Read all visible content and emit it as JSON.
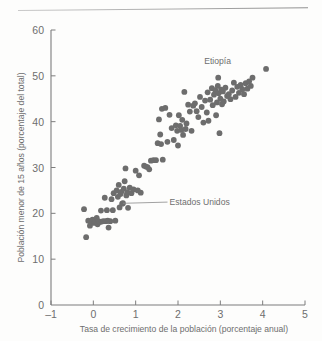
{
  "figure": {
    "kind": "scatter-plot",
    "dot_color": "#6d6d6d",
    "axis_color": "#7d7d7d",
    "text_color": "#6e6e6e"
  },
  "chart_data": {
    "type": "scatter",
    "title": "",
    "xlabel": "Tasa de crecimiento de la población (porcentaje anual)",
    "ylabel": "Población menor de 15 años (porcentaje del total)",
    "xlim": [
      -1,
      5
    ],
    "ylim": [
      0,
      60
    ],
    "xticks": [
      -1,
      0,
      1,
      2,
      3,
      4,
      5
    ],
    "xtick_labels": [
      "–1",
      "0",
      "1",
      "2",
      "3",
      "4",
      "5"
    ],
    "yticks": [
      0,
      10,
      20,
      30,
      40,
      50,
      60
    ],
    "ytick_labels": [
      "0",
      "10",
      "20",
      "30",
      "40",
      "50",
      "60"
    ],
    "grid": false,
    "legend": null,
    "annotations": [
      {
        "label": "Etiopía",
        "text_x": 2.62,
        "text_y": 52.6,
        "point_x": 2.95,
        "point_y": 49.6,
        "leader": false
      },
      {
        "label": "Estados Unidos",
        "text_x": 1.8,
        "text_y": 21.8,
        "point_x": 0.7,
        "point_y": 22.2,
        "leader": true
      }
    ],
    "points": [
      [
        -0.22,
        20.9
      ],
      [
        -0.17,
        14.8
      ],
      [
        -0.12,
        18.4
      ],
      [
        -0.08,
        17.3
      ],
      [
        -0.05,
        18.0
      ],
      [
        -0.02,
        18.6
      ],
      [
        0.02,
        17.9
      ],
      [
        0.05,
        18.2
      ],
      [
        0.08,
        19.0
      ],
      [
        0.1,
        17.6
      ],
      [
        0.12,
        18.3
      ],
      [
        0.15,
        18.1
      ],
      [
        0.18,
        20.6
      ],
      [
        0.2,
        18.2
      ],
      [
        0.24,
        18.3
      ],
      [
        0.27,
        23.4
      ],
      [
        0.3,
        18.3
      ],
      [
        0.32,
        20.7
      ],
      [
        0.34,
        18.4
      ],
      [
        0.36,
        16.9
      ],
      [
        0.4,
        18.3
      ],
      [
        0.43,
        23.1
      ],
      [
        0.46,
        20.7
      ],
      [
        0.48,
        24.4
      ],
      [
        0.52,
        18.4
      ],
      [
        0.55,
        25.0
      ],
      [
        0.58,
        23.6
      ],
      [
        0.6,
        26.2
      ],
      [
        0.62,
        21.3
      ],
      [
        0.64,
        24.2
      ],
      [
        0.66,
        24.7
      ],
      [
        0.68,
        22.1
      ],
      [
        0.7,
        22.2
      ],
      [
        0.72,
        25.4
      ],
      [
        0.74,
        27.0
      ],
      [
        0.76,
        29.8
      ],
      [
        0.78,
        23.9
      ],
      [
        0.8,
        24.6
      ],
      [
        0.82,
        21.2
      ],
      [
        0.86,
        25.6
      ],
      [
        0.9,
        24.4
      ],
      [
        0.95,
        25.2
      ],
      [
        1.0,
        29.3
      ],
      [
        1.05,
        25.0
      ],
      [
        1.08,
        28.3
      ],
      [
        1.12,
        24.5
      ],
      [
        1.2,
        30.4
      ],
      [
        1.24,
        30.2
      ],
      [
        1.28,
        30.1
      ],
      [
        1.32,
        29.6
      ],
      [
        1.36,
        31.5
      ],
      [
        1.42,
        31.6
      ],
      [
        1.48,
        31.6
      ],
      [
        1.52,
        35.3
      ],
      [
        1.55,
        40.5
      ],
      [
        1.58,
        37.2
      ],
      [
        1.6,
        35.1
      ],
      [
        1.62,
        42.8
      ],
      [
        1.64,
        31.7
      ],
      [
        1.7,
        43.0
      ],
      [
        1.75,
        35.6
      ],
      [
        1.8,
        41.5
      ],
      [
        1.85,
        38.6
      ],
      [
        1.9,
        36.0
      ],
      [
        1.95,
        39.2
      ],
      [
        1.98,
        38.0
      ],
      [
        2.0,
        34.8
      ],
      [
        2.02,
        41.4
      ],
      [
        2.05,
        39.1
      ],
      [
        2.08,
        38.2
      ],
      [
        2.1,
        40.4
      ],
      [
        2.12,
        37.1
      ],
      [
        2.15,
        46.5
      ],
      [
        2.18,
        38.4
      ],
      [
        2.2,
        39.6
      ],
      [
        2.24,
        43.7
      ],
      [
        2.28,
        42.2
      ],
      [
        2.32,
        38.0
      ],
      [
        2.36,
        43.5
      ],
      [
        2.4,
        44.0
      ],
      [
        2.44,
        42.3
      ],
      [
        2.48,
        41.0
      ],
      [
        2.52,
        45.4
      ],
      [
        2.56,
        43.2
      ],
      [
        2.6,
        39.8
      ],
      [
        2.64,
        44.6
      ],
      [
        2.68,
        42.0
      ],
      [
        2.7,
        46.4
      ],
      [
        2.72,
        40.2
      ],
      [
        2.76,
        44.8
      ],
      [
        2.8,
        47.3
      ],
      [
        2.82,
        43.6
      ],
      [
        2.85,
        45.9
      ],
      [
        2.88,
        46.9
      ],
      [
        2.9,
        41.4
      ],
      [
        2.92,
        44.2
      ],
      [
        2.94,
        47.8
      ],
      [
        2.95,
        49.6
      ],
      [
        2.96,
        46.2
      ],
      [
        2.98,
        37.5
      ],
      [
        3.0,
        45.0
      ],
      [
        3.02,
        47.0
      ],
      [
        3.04,
        43.8
      ],
      [
        3.06,
        46.6
      ],
      [
        3.08,
        44.4
      ],
      [
        3.12,
        47.4
      ],
      [
        3.16,
        45.6
      ],
      [
        3.2,
        46.0
      ],
      [
        3.24,
        44.9
      ],
      [
        3.28,
        46.8
      ],
      [
        3.32,
        48.5
      ],
      [
        3.36,
        45.4
      ],
      [
        3.4,
        47.6
      ],
      [
        3.44,
        46.3
      ],
      [
        3.48,
        48.0
      ],
      [
        3.52,
        47.1
      ],
      [
        3.56,
        46.0
      ],
      [
        3.6,
        48.4
      ],
      [
        3.64,
        47.2
      ],
      [
        3.68,
        48.8
      ],
      [
        3.72,
        47.8
      ],
      [
        3.76,
        49.6
      ],
      [
        4.08,
        51.5
      ]
    ]
  }
}
